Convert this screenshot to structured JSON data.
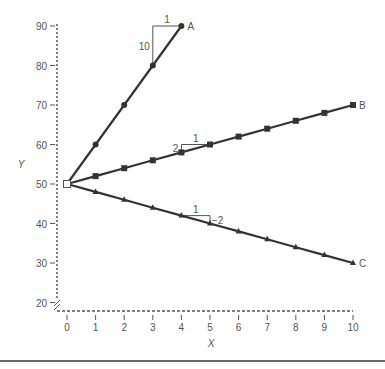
{
  "chart_data": {
    "type": "line",
    "title": "",
    "xlabel": "X",
    "ylabel": "Y",
    "xlim": [
      0,
      10
    ],
    "ylim": [
      20,
      90
    ],
    "x_ticks": [
      0,
      1,
      2,
      3,
      4,
      5,
      6,
      7,
      8,
      9,
      10
    ],
    "y_ticks": [
      20,
      30,
      40,
      50,
      60,
      70,
      80,
      90
    ],
    "grid": false,
    "axis_break": "y-axis broken near 20 (double slash)",
    "start_point": {
      "x": 0,
      "y": 50,
      "marker": "open-square"
    },
    "series": [
      {
        "name": "A",
        "slope": 10,
        "marker": "circle",
        "x": [
          0,
          1,
          2,
          3,
          4
        ],
        "y": [
          50,
          60,
          70,
          80,
          90
        ]
      },
      {
        "name": "B",
        "slope": 2,
        "marker": "square",
        "x": [
          0,
          1,
          2,
          3,
          4,
          5,
          6,
          7,
          8,
          9,
          10
        ],
        "y": [
          50,
          52,
          54,
          56,
          58,
          60,
          62,
          64,
          66,
          68,
          70
        ]
      },
      {
        "name": "C",
        "slope": -2,
        "marker": "triangle",
        "x": [
          0,
          1,
          2,
          3,
          4,
          5,
          6,
          7,
          8,
          9,
          10
        ],
        "y": [
          50,
          48,
          46,
          44,
          42,
          40,
          38,
          36,
          34,
          32,
          30
        ]
      }
    ],
    "annotations": [
      {
        "series": "A",
        "type": "slope-triangle",
        "run_label": "1",
        "rise_label": "10",
        "from_x": 3,
        "to_x": 4
      },
      {
        "series": "B",
        "type": "slope-triangle",
        "run_label": "1",
        "rise_label": "2",
        "from_x": 4,
        "to_x": 5
      },
      {
        "series": "C",
        "type": "slope-triangle",
        "run_label": "1",
        "rise_label": "−2",
        "from_x": 4,
        "to_x": 5
      }
    ]
  },
  "colors": {
    "line": "#333333",
    "axis": "#555555",
    "text": "#555555"
  }
}
